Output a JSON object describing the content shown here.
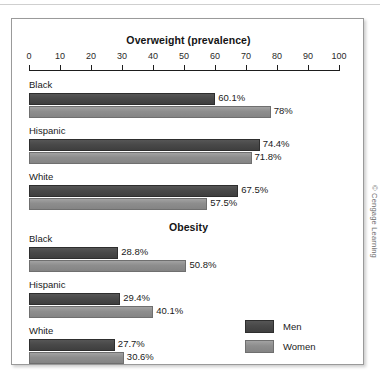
{
  "credit": "© Cengage Learning",
  "legend": {
    "items": [
      {
        "label": "Men",
        "key": "men",
        "color": "#494949"
      },
      {
        "label": "Women",
        "key": "women",
        "color": "#8d8d8d"
      }
    ]
  },
  "chart_data": [
    {
      "type": "bar",
      "title": "Overweight (prevalence)",
      "orientation": "horizontal",
      "categories": [
        "Black",
        "Hispanic",
        "White"
      ],
      "series": [
        {
          "name": "Men",
          "values": [
            60.1,
            74.4,
            67.5
          ],
          "labels": [
            "60.1%",
            "74.4%",
            "67.5%"
          ]
        },
        {
          "name": "Women",
          "values": [
            78.0,
            71.8,
            57.5
          ],
          "labels": [
            "78%",
            "71.8%",
            "57.5%"
          ]
        }
      ],
      "xlabel": "",
      "ylabel": "",
      "xlim": [
        0,
        100
      ],
      "xticks": [
        0,
        10,
        20,
        30,
        40,
        50,
        60,
        70,
        80,
        90,
        100
      ],
      "grid": false,
      "legend_position": "bottom-right"
    },
    {
      "type": "bar",
      "title": "Obesity",
      "orientation": "horizontal",
      "categories": [
        "Black",
        "Hispanic",
        "White"
      ],
      "series": [
        {
          "name": "Men",
          "values": [
            28.8,
            29.4,
            27.7
          ],
          "labels": [
            "28.8%",
            "29.4%",
            "27.7%"
          ]
        },
        {
          "name": "Women",
          "values": [
            50.8,
            40.1,
            30.6
          ],
          "labels": [
            "50.8%",
            "40.1%",
            "30.6%"
          ]
        }
      ],
      "xlabel": "",
      "ylabel": "",
      "xlim": [
        0,
        100
      ],
      "xticks": [
        0,
        10,
        20,
        30,
        40,
        50,
        60,
        70,
        80,
        90,
        100
      ],
      "grid": false,
      "legend_position": "bottom-right"
    }
  ]
}
